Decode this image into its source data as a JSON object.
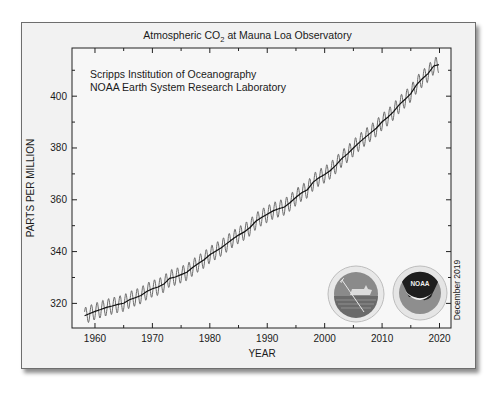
{
  "chart_data": {
    "type": "line",
    "title": "Atmospheric CO",
    "title_subscript": "2",
    "title_suffix": " at Mauna Loa Observatory",
    "credits": [
      "Scripps Institution of Oceanography",
      "NOAA Earth System Research Laboratory"
    ],
    "xlabel": "YEAR",
    "ylabel": "PARTS PER MILLION",
    "date_note": "December 2019",
    "xlim": [
      1956,
      2022
    ],
    "ylim": [
      310.5,
      418.6
    ],
    "x_ticks": [
      1960,
      1970,
      1980,
      1990,
      2000,
      2010,
      2020
    ],
    "x_minor_ticks": [
      1965,
      1975,
      1985,
      1995,
      2005,
      2015
    ],
    "y_ticks": [
      320,
      340,
      360,
      380,
      400
    ],
    "y_minor_ticks": [
      330,
      350,
      370,
      390,
      410
    ],
    "grid": false,
    "seasonal_amplitude_ppm": 3.2,
    "series": [
      {
        "name": "Monthly mean (seasonal cycle)",
        "color": "#555555",
        "style": "seasonal"
      },
      {
        "name": "Annual trend",
        "color": "#111111",
        "x": [
          1958.2,
          1959,
          1960,
          1961,
          1962,
          1963,
          1964,
          1965,
          1966,
          1967,
          1968,
          1969,
          1970,
          1971,
          1972,
          1973,
          1974,
          1975,
          1976,
          1977,
          1978,
          1979,
          1980,
          1981,
          1982,
          1983,
          1984,
          1985,
          1986,
          1987,
          1988,
          1989,
          1990,
          1991,
          1992,
          1993,
          1994,
          1995,
          1996,
          1997,
          1998,
          1999,
          2000,
          2001,
          2002,
          2003,
          2004,
          2005,
          2006,
          2007,
          2008,
          2009,
          2010,
          2011,
          2012,
          2013,
          2014,
          2015,
          2016,
          2017,
          2018,
          2019,
          2019.9
        ],
        "values": [
          315.2,
          315.97,
          316.91,
          317.64,
          318.45,
          318.99,
          319.62,
          320.04,
          321.37,
          322.18,
          323.05,
          324.62,
          325.68,
          326.32,
          327.46,
          329.68,
          330.19,
          331.12,
          332.03,
          333.84,
          335.41,
          336.84,
          338.76,
          340.12,
          341.48,
          343.15,
          344.87,
          346.35,
          347.61,
          349.31,
          351.69,
          353.2,
          354.45,
          355.7,
          356.54,
          357.21,
          358.96,
          360.97,
          362.74,
          363.88,
          366.84,
          368.54,
          369.71,
          371.32,
          373.45,
          375.98,
          377.7,
          379.98,
          382.09,
          384.02,
          385.83,
          387.64,
          390.1,
          391.85,
          394.06,
          396.74,
          398.81,
          401.01,
          404.41,
          406.76,
          408.72,
          411.66,
          412.2
        ]
      }
    ]
  },
  "logos": [
    {
      "name": "scripps-logo",
      "description": "Scripps Institution of Oceanography seal with ship and trident"
    },
    {
      "name": "noaa-logo",
      "label": "NOAA"
    }
  ]
}
